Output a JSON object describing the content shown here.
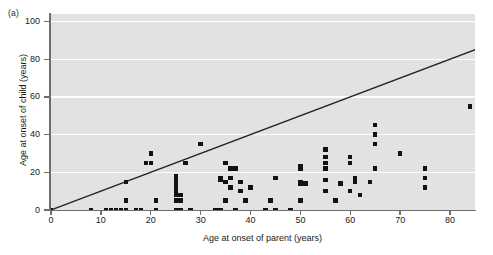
{
  "panel": {
    "label": "(a)"
  },
  "chart_data": {
    "type": "scatter",
    "title": "",
    "xlabel": "Age at onset of parent (years)",
    "ylabel": "Age at onset of child (years)",
    "xlim": [
      0,
      85
    ],
    "ylim": [
      0,
      104
    ],
    "xticks": [
      0,
      10,
      20,
      30,
      40,
      50,
      60,
      70,
      80
    ],
    "yticks": [
      0,
      20,
      40,
      60,
      80,
      100
    ],
    "xtick_labels": [
      "0",
      "10",
      "20",
      "30",
      "40",
      "50",
      "60",
      "70",
      "80"
    ],
    "ytick_labels": [
      "0",
      "20",
      "40",
      "60",
      "80",
      "100"
    ],
    "grid": "horizontal-white-gridlines",
    "legend": "none",
    "plot_background": "#e2e2e2",
    "marker_color": "#121212",
    "marker_shape": "square",
    "reference_line": {
      "name": "identity-line",
      "description": "y = x diagonal line",
      "from": [
        0,
        0
      ],
      "to": [
        100,
        100
      ],
      "color": "#222222"
    },
    "points": [
      [
        0,
        0
      ],
      [
        8,
        0
      ],
      [
        11,
        0
      ],
      [
        12,
        0
      ],
      [
        13,
        0
      ],
      [
        14,
        0
      ],
      [
        15,
        0
      ],
      [
        15,
        5
      ],
      [
        15,
        15
      ],
      [
        17,
        0
      ],
      [
        18,
        0
      ],
      [
        19,
        25
      ],
      [
        20,
        25
      ],
      [
        20,
        30
      ],
      [
        21,
        0
      ],
      [
        21,
        5
      ],
      [
        25,
        0
      ],
      [
        25,
        5
      ],
      [
        25,
        8
      ],
      [
        25,
        10
      ],
      [
        25,
        11
      ],
      [
        25,
        12
      ],
      [
        25,
        13
      ],
      [
        25,
        14
      ],
      [
        25,
        15
      ],
      [
        25,
        16
      ],
      [
        25,
        17
      ],
      [
        25,
        18
      ],
      [
        26,
        0
      ],
      [
        26,
        5
      ],
      [
        26,
        8
      ],
      [
        27,
        25
      ],
      [
        28,
        0
      ],
      [
        30,
        35
      ],
      [
        33,
        0
      ],
      [
        34,
        0
      ],
      [
        34,
        16
      ],
      [
        34,
        17
      ],
      [
        35,
        15
      ],
      [
        35,
        25
      ],
      [
        35,
        5
      ],
      [
        36,
        12
      ],
      [
        36,
        17
      ],
      [
        36,
        22
      ],
      [
        37,
        0
      ],
      [
        37,
        22
      ],
      [
        38,
        10
      ],
      [
        38,
        15
      ],
      [
        39,
        5
      ],
      [
        40,
        12
      ],
      [
        43,
        0
      ],
      [
        44,
        5
      ],
      [
        45,
        0
      ],
      [
        45,
        17
      ],
      [
        48,
        0
      ],
      [
        50,
        5
      ],
      [
        50,
        14
      ],
      [
        50,
        15
      ],
      [
        50,
        22
      ],
      [
        50,
        23
      ],
      [
        51,
        14
      ],
      [
        55,
        10
      ],
      [
        55,
        16
      ],
      [
        55,
        22
      ],
      [
        55,
        25
      ],
      [
        55,
        28
      ],
      [
        55,
        32
      ],
      [
        57,
        5
      ],
      [
        58,
        14
      ],
      [
        60,
        10
      ],
      [
        60,
        25
      ],
      [
        60,
        28
      ],
      [
        61,
        15
      ],
      [
        61,
        17
      ],
      [
        62,
        8
      ],
      [
        64,
        15
      ],
      [
        65,
        22
      ],
      [
        65,
        35
      ],
      [
        65,
        40
      ],
      [
        65,
        45
      ],
      [
        70,
        30
      ],
      [
        75,
        12
      ],
      [
        75,
        17
      ],
      [
        75,
        22
      ],
      [
        84,
        55
      ]
    ]
  }
}
